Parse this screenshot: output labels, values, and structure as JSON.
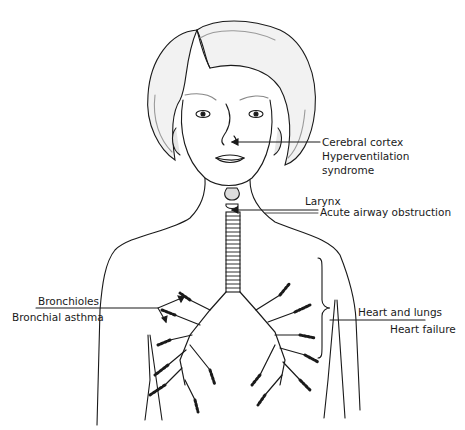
{
  "diagram": {
    "labels": {
      "cortex_title": "Cerebral cortex",
      "cortex_cond1": "Hyperventilation",
      "cortex_cond2": "syndrome",
      "larynx_title": "Larynx",
      "larynx_cond": "Acute airway obstruction",
      "bronch_title": "Bronchioles",
      "bronch_cond": "Bronchial asthma",
      "heart_title": "Heart and lungs",
      "heart_cond": "Heart failure"
    },
    "colors": {
      "line": "#1a1a1a",
      "background": "#ffffff",
      "shade": "#cfcfcf"
    }
  }
}
